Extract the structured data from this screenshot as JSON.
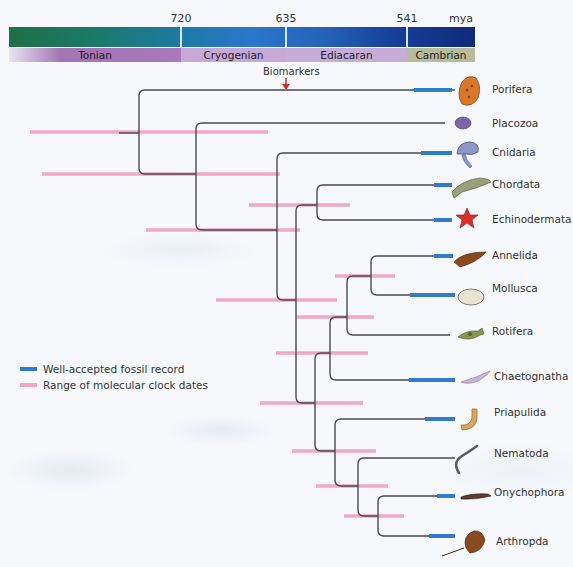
{
  "timescale": {
    "unit_label": "mya",
    "ticks": [
      {
        "label": "720",
        "x": 181
      },
      {
        "label": "635",
        "x": 286
      },
      {
        "label": "541",
        "x": 407
      },
      {
        "label": "mya",
        "x": 461
      }
    ],
    "periods": [
      {
        "name": "Tonian",
        "x0": 0,
        "x1": 172
      },
      {
        "name": "Cryogenian",
        "x0": 172,
        "x1": 277
      },
      {
        "name": "Ediacaran",
        "x0": 277,
        "x1": 398
      },
      {
        "name": "Cambrian",
        "x0": 398,
        "x1": 466
      }
    ]
  },
  "biomarkers": {
    "label": "Biomarkers",
    "arrow_x": 286
  },
  "colors": {
    "branch": "#4a4a52",
    "fossil": "#2f7bd0",
    "clock": "#f0a8c4",
    "arrow": "#d42a2a"
  },
  "taxa": [
    {
      "name": "Porifera",
      "y": 90,
      "fossil": [
        414,
        452
      ],
      "icon": "sponge-icon"
    },
    {
      "name": "Placozoa",
      "y": 123,
      "fossil": null,
      "icon": "placozoan-icon"
    },
    {
      "name": "Cnidaria",
      "y": 153,
      "fossil": [
        421,
        452
      ],
      "icon": "jellyfish-icon"
    },
    {
      "name": "Chordata",
      "y": 185,
      "fossil": [
        434,
        452
      ],
      "icon": "fish-icon"
    },
    {
      "name": "Echinodermata",
      "y": 220,
      "fossil": [
        434,
        452
      ],
      "icon": "starfish-icon"
    },
    {
      "name": "Annelida",
      "y": 256,
      "fossil": [
        434,
        453
      ],
      "icon": "annelid-icon"
    },
    {
      "name": "Mollusca",
      "y": 295,
      "fossil": [
        410,
        455
      ],
      "icon": "mollusc-icon"
    },
    {
      "name": "Rotifera",
      "y": 335,
      "fossil": null,
      "icon": "rotifer-icon"
    },
    {
      "name": "Chaetognatha",
      "y": 380,
      "fossil": [
        409,
        455
      ],
      "icon": "arrow-worm-icon"
    },
    {
      "name": "Priapulida",
      "y": 419,
      "fossil": [
        425,
        455
      ],
      "icon": "priapulid-icon"
    },
    {
      "name": "Nematoda",
      "y": 458,
      "fossil": null,
      "icon": "nematode-icon"
    },
    {
      "name": "Onychophora",
      "y": 496,
      "fossil": [
        437,
        455
      ],
      "icon": "velvet-worm-icon"
    },
    {
      "name": "Arthropda",
      "y": 536,
      "fossil": [
        429,
        455
      ],
      "icon": "horseshoe-crab-icon"
    }
  ],
  "clock_ranges": [
    {
      "y": 132,
      "x0": 30,
      "x1": 268
    },
    {
      "y": 174,
      "x0": 42,
      "x1": 280
    },
    {
      "y": 205,
      "x0": 249,
      "x1": 350
    },
    {
      "y": 230,
      "x0": 146,
      "x1": 300
    },
    {
      "y": 276,
      "x0": 335,
      "x1": 395
    },
    {
      "y": 300,
      "x0": 216,
      "x1": 337
    },
    {
      "y": 317,
      "x0": 296,
      "x1": 374
    },
    {
      "y": 353,
      "x0": 276,
      "x1": 368
    },
    {
      "y": 403,
      "x0": 260,
      "x1": 363
    },
    {
      "y": 451,
      "x0": 292,
      "x1": 376
    },
    {
      "y": 486,
      "x0": 316,
      "x1": 388
    },
    {
      "y": 516,
      "x0": 344,
      "x1": 404
    }
  ],
  "legend": {
    "items": [
      {
        "label": "Well-accepted fossil record",
        "kind": "fossil"
      },
      {
        "label": "Range of molecular clock dates",
        "kind": "clock"
      }
    ]
  }
}
